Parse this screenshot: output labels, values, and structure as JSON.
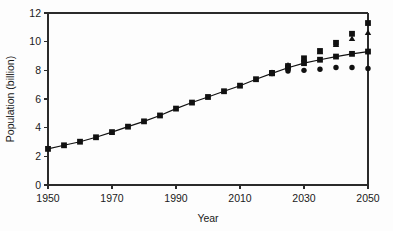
{
  "chart_data": {
    "type": "scatter",
    "title": "",
    "xlabel": "Year",
    "ylabel": "Population (billion)",
    "xlim": [
      1950,
      2050
    ],
    "ylim": [
      0,
      12
    ],
    "xticks": [
      1950,
      1970,
      1990,
      2010,
      2030,
      2050
    ],
    "yticks": [
      0,
      2,
      4,
      6,
      8,
      10,
      12
    ],
    "xtick_labels": [
      "1950",
      "1970",
      "1990",
      "2010",
      "2030",
      "2050"
    ],
    "ytick_labels": [
      "0",
      "2",
      "4",
      "6",
      "8",
      "10",
      "12"
    ],
    "grid": false,
    "legend": "none",
    "series": [
      {
        "name": "medium-variant",
        "marker": "square",
        "line": true,
        "x": [
          1950,
          1955,
          1960,
          1965,
          1970,
          1975,
          1980,
          1985,
          1990,
          1995,
          2000,
          2005,
          2010,
          2015,
          2020,
          2025,
          2030,
          2035,
          2040,
          2045,
          2050
        ],
        "values": [
          2.52,
          2.77,
          3.02,
          3.33,
          3.69,
          4.07,
          4.44,
          4.85,
          5.33,
          5.75,
          6.14,
          6.54,
          6.93,
          7.38,
          7.79,
          8.18,
          8.5,
          8.74,
          8.96,
          9.15,
          9.31
        ]
      },
      {
        "name": "high-variant",
        "marker": "square",
        "line": false,
        "x": [
          2020,
          2025,
          2030,
          2035,
          2040,
          2045,
          2050
        ],
        "values": [
          7.82,
          8.3,
          8.84,
          9.35,
          9.92,
          10.55,
          11.3
        ]
      },
      {
        "name": "constant-fertility-variant",
        "marker": "triangle",
        "line": false,
        "x": [
          2020,
          2025,
          2030,
          2035,
          2040,
          2045,
          2050
        ],
        "values": [
          7.82,
          8.35,
          8.77,
          9.27,
          9.77,
          10.2,
          10.62
        ]
      },
      {
        "name": "low-variant",
        "marker": "circle",
        "line": false,
        "x": [
          2020,
          2025,
          2030,
          2035,
          2040,
          2045,
          2050
        ],
        "values": [
          7.78,
          7.95,
          8.0,
          8.08,
          8.2,
          8.2,
          8.13
        ]
      }
    ]
  },
  "axes": {
    "x_title": "Year",
    "y_title": "Population (billion)"
  }
}
